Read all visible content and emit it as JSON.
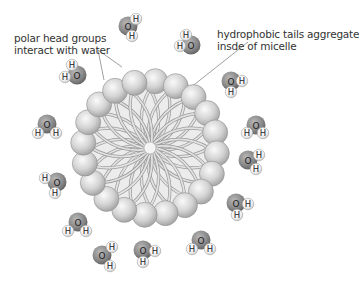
{
  "labels": {
    "polar_heads": {
      "line1": "polar head groups",
      "line2": "interact with water"
    },
    "hydrophobic_tails": {
      "line1": "hydrophobic tails aggregate",
      "line2": "insde of micelle"
    }
  },
  "atoms": {
    "oxygen": "O",
    "hydrogen": "H"
  },
  "colors": {
    "oxygen": "#8a8a8a",
    "hydrogen": "#f2f2f2",
    "head": "#cfcfcf",
    "tail": "#bdbdbd",
    "core_fill": "#ececec",
    "text": "#333333",
    "leader_line": "#888888"
  },
  "micelle": {
    "cx": 150,
    "cy": 148,
    "head_ring_radius": 67,
    "head_radius": 12.5,
    "head_count": 20
  },
  "water_molecules": [
    {
      "ox": 128,
      "oy": 26,
      "h": [
        [
          136,
          19
        ],
        [
          132,
          36
        ]
      ]
    },
    {
      "ox": 191,
      "oy": 45,
      "h": [
        [
          186,
          35
        ],
        [
          180,
          46
        ]
      ]
    },
    {
      "ox": 77,
      "oy": 75,
      "h": [
        [
          72,
          65
        ],
        [
          65,
          77
        ]
      ]
    },
    {
      "ox": 231,
      "oy": 81,
      "h": [
        [
          242,
          81
        ],
        [
          231,
          92
        ]
      ]
    },
    {
      "ox": 47,
      "oy": 124,
      "h": [
        [
          38,
          133
        ],
        [
          56,
          133
        ]
      ]
    },
    {
      "ox": 256,
      "oy": 125,
      "h": [
        [
          247,
          133
        ],
        [
          263,
          133
        ]
      ]
    },
    {
      "ox": 57,
      "oy": 182,
      "h": [
        [
          45,
          178
        ],
        [
          55,
          193
        ]
      ]
    },
    {
      "ox": 248,
      "oy": 160,
      "h": [
        [
          259,
          155
        ],
        [
          256,
          169
        ]
      ]
    },
    {
      "ox": 78,
      "oy": 222,
      "h": [
        [
          68,
          231
        ],
        [
          86,
          231
        ]
      ]
    },
    {
      "ox": 236,
      "oy": 203,
      "h": [
        [
          248,
          204
        ],
        [
          237,
          215
        ]
      ]
    },
    {
      "ox": 102,
      "oy": 255,
      "h": [
        [
          112,
          247
        ],
        [
          110,
          266
        ]
      ]
    },
    {
      "ox": 143,
      "oy": 250,
      "h": [
        [
          155,
          251
        ],
        [
          143,
          262
        ]
      ]
    },
    {
      "ox": 201,
      "oy": 240,
      "h": [
        [
          192,
          249
        ],
        [
          210,
          249
        ]
      ]
    },
    {
      "ox": 293,
      "oy": 130,
      "h": []
    }
  ]
}
